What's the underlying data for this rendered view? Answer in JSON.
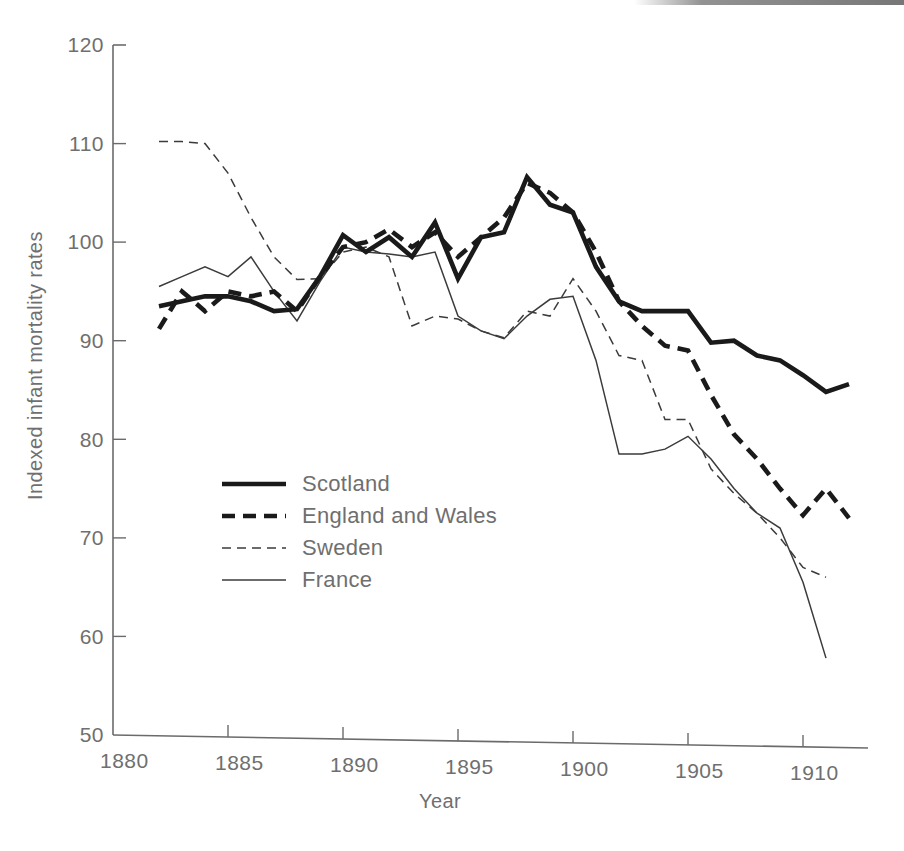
{
  "chart_data": {
    "type": "line",
    "title": "",
    "xlabel": "Year",
    "ylabel": "Indexed infant mortality rates",
    "xlim": [
      1880,
      1913
    ],
    "ylim": [
      50,
      120
    ],
    "xticks": [
      1880,
      1885,
      1890,
      1895,
      1900,
      1905,
      1910
    ],
    "yticks": [
      50,
      60,
      70,
      80,
      90,
      100,
      110,
      120
    ],
    "grid": false,
    "legend_position": "center-left",
    "series": [
      {
        "name": "Scotland",
        "style": "thick-solid",
        "color": "#1a1a1a",
        "x": [
          1882,
          1883,
          1884,
          1885,
          1886,
          1887,
          1888,
          1889,
          1890,
          1891,
          1892,
          1893,
          1894,
          1895,
          1896,
          1897,
          1898,
          1899,
          1900,
          1901,
          1902,
          1903,
          1904,
          1905,
          1906,
          1907,
          1908,
          1909,
          1910,
          1911,
          1912
        ],
        "values": [
          93.5,
          94.0,
          94.5,
          94.5,
          94.0,
          93.0,
          93.2,
          96.5,
          100.7,
          99.0,
          100.5,
          98.5,
          102.0,
          96.3,
          100.5,
          101.0,
          106.6,
          103.8,
          103.0,
          97.5,
          94.0,
          93.0,
          93.0,
          93.0,
          89.8,
          90.0,
          88.5,
          88.0,
          86.5,
          84.8,
          85.6
        ]
      },
      {
        "name": "England and Wales",
        "style": "thick-dashed",
        "color": "#1a1a1a",
        "x": [
          1882,
          1883,
          1884,
          1885,
          1886,
          1887,
          1888,
          1889,
          1890,
          1891,
          1892,
          1893,
          1894,
          1895,
          1896,
          1897,
          1898,
          1899,
          1900,
          1901,
          1902,
          1903,
          1904,
          1905,
          1906,
          1907,
          1908,
          1909,
          1910,
          1911,
          1912
        ],
        "values": [
          91.2,
          95.0,
          93.0,
          95.0,
          94.5,
          95.0,
          93.0,
          96.5,
          99.5,
          100.0,
          101.3,
          99.5,
          101.0,
          98.5,
          100.5,
          102.5,
          106.0,
          105.0,
          103.0,
          99.0,
          94.0,
          91.5,
          89.5,
          89.0,
          84.5,
          80.5,
          78.0,
          75.0,
          72.3,
          75.0,
          72.0
        ]
      },
      {
        "name": "Sweden",
        "style": "thin-dashed",
        "color": "#3b3b3b",
        "x": [
          1882,
          1883,
          1884,
          1885,
          1886,
          1887,
          1888,
          1889,
          1890,
          1891,
          1892,
          1893,
          1894,
          1895,
          1896,
          1897,
          1898,
          1899,
          1900,
          1901,
          1902,
          1903,
          1904,
          1905,
          1906,
          1907,
          1908,
          1909,
          1910,
          1911
        ],
        "values": [
          110.2,
          110.2,
          110.0,
          107.0,
          102.5,
          98.5,
          96.2,
          96.3,
          99.0,
          99.5,
          98.5,
          91.5,
          92.5,
          92.2,
          91.0,
          90.3,
          93.0,
          92.5,
          96.3,
          93.0,
          88.5,
          88.0,
          82.0,
          82.0,
          77.0,
          74.5,
          72.5,
          70.0,
          67.0,
          66.0
        ]
      },
      {
        "name": "France",
        "style": "thin-solid",
        "color": "#3b3b3b",
        "x": [
          1882,
          1883,
          1884,
          1885,
          1886,
          1887,
          1888,
          1889,
          1890,
          1891,
          1892,
          1893,
          1894,
          1895,
          1896,
          1897,
          1898,
          1899,
          1900,
          1901,
          1902,
          1903,
          1904,
          1905,
          1906,
          1907,
          1908,
          1909,
          1910,
          1911
        ],
        "values": [
          95.5,
          96.5,
          97.5,
          96.5,
          98.5,
          95.0,
          92.0,
          96.0,
          99.5,
          99.0,
          98.8,
          98.5,
          99.0,
          92.5,
          91.0,
          90.2,
          92.5,
          94.2,
          94.5,
          88.0,
          78.5,
          78.5,
          79.0,
          80.3,
          78.0,
          75.0,
          72.5,
          71.0,
          65.5,
          57.8
        ]
      }
    ]
  },
  "axes": {
    "y_title": "Indexed infant mortality rates",
    "x_title": "Year",
    "y_tick_labels": [
      "120",
      "110",
      "100",
      "90",
      "80",
      "70",
      "60",
      "50"
    ],
    "x_tick_labels": [
      "1880",
      "1885",
      "1890",
      "1895",
      "1900",
      "1905",
      "1910"
    ]
  },
  "legend": {
    "items": [
      {
        "label": "Scotland",
        "style": "thick-solid"
      },
      {
        "label": "England and Wales",
        "style": "thick-dashed"
      },
      {
        "label": "Sweden",
        "style": "thin-dashed"
      },
      {
        "label": "France",
        "style": "thin-solid"
      }
    ]
  }
}
